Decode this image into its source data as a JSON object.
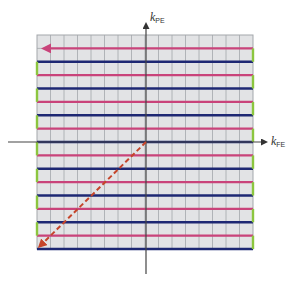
{
  "diagram": {
    "axes": {
      "horizontal": {
        "symbol": "k",
        "subscript": "FE",
        "label": "kFE"
      },
      "vertical": {
        "symbol": "k",
        "subscript": "PE",
        "label": "kPE"
      }
    },
    "grid": {
      "columns": 16,
      "rows": 16,
      "left": 37,
      "top": 35,
      "right": 253,
      "bottom": 249
    },
    "trajectory": {
      "description": "Alternating left/right readout lines; pink lines traverse one direction, blue the other; green short segments mark phase-encode blips at edges",
      "line_count": 16,
      "start_arrow": "leftward arrow on top pink line",
      "prephase_arrow": "dashed diagonal from origin to bottom-left corner"
    },
    "colors": {
      "grid_fill": "#e2e3e5",
      "grid_line": "#a3a7ab",
      "readout_pink": "#c9437a",
      "readout_blue": "#1e2873",
      "blip_green": "#8cc63f",
      "dashed_arrow": "#c5452b",
      "axis": "#555555"
    }
  }
}
